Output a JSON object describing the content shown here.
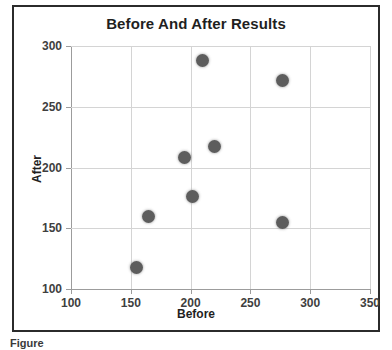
{
  "figure": {
    "caption": "Figure",
    "axis_title_x": "Before",
    "axis_title_y": "After"
  },
  "chart_data": {
    "type": "scatter",
    "title": "Before And After Results",
    "xlabel": "Before",
    "ylabel": "After",
    "xlim": [
      100,
      350
    ],
    "ylim": [
      100,
      300
    ],
    "xticks": [
      100,
      150,
      200,
      250,
      300,
      350
    ],
    "yticks": [
      100,
      150,
      200,
      250,
      300
    ],
    "grid": true,
    "legend": null,
    "marker_color": "#5d5d5d",
    "points": [
      {
        "x": 155,
        "y": 118
      },
      {
        "x": 165,
        "y": 160
      },
      {
        "x": 195,
        "y": 208
      },
      {
        "x": 202,
        "y": 176
      },
      {
        "x": 210,
        "y": 288
      },
      {
        "x": 220,
        "y": 217
      },
      {
        "x": 277,
        "y": 155
      },
      {
        "x": 277,
        "y": 272
      }
    ]
  }
}
